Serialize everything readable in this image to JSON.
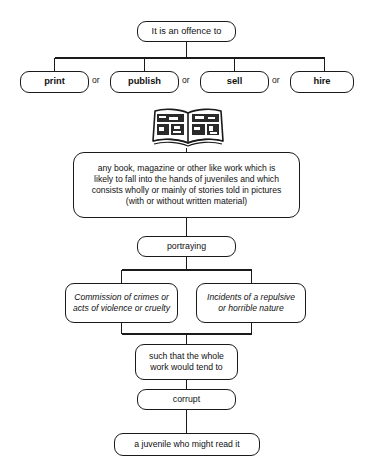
{
  "diagram": {
    "title_node": {
      "label": "It is an offence to"
    },
    "verbs": [
      {
        "label": "print"
      },
      {
        "label": "publish"
      },
      {
        "label": "sell"
      },
      {
        "label": "hire"
      }
    ],
    "separators": [
      {
        "label": "or"
      },
      {
        "label": "or"
      },
      {
        "label": "or"
      }
    ],
    "illustration": {
      "name": "open-comic-book-illustration"
    },
    "definition_node": {
      "label": "any book, magazine or other like work which is\nlikely to fall into the hands of juveniles and which\nconsists wholly or mainly of stories told in pictures\n(with or without written material)"
    },
    "portraying_node": {
      "label": "portraying"
    },
    "branches": [
      {
        "label": "Commission of crimes or\nacts of violence or cruelty"
      },
      {
        "label": "Incidents of a repulsive\nor horrible nature"
      }
    ],
    "such_that_node": {
      "label": "such that the whole\nwork would tend to"
    },
    "corrupt_node": {
      "label": "corrupt"
    },
    "target_node": {
      "label": "a juvenile who might read it"
    }
  },
  "colors": {
    "line": "#1a1a1a",
    "background": "#ffffff",
    "text": "#111111"
  }
}
